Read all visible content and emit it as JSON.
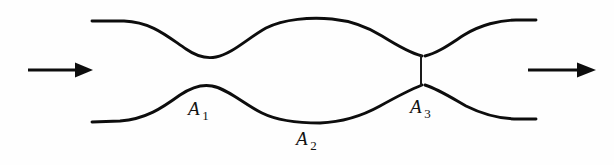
{
  "figure": {
    "name": "converging-diverging-duct-cross-sections",
    "type": "diagram",
    "background_color": "#fefefe",
    "stroke_color": "#0d0d0d",
    "width": 614,
    "height": 165
  },
  "labels": {
    "a1": {
      "symbol": "A",
      "subscript": "1",
      "x": 188,
      "y": 99
    },
    "a2": {
      "symbol": "A",
      "subscript": "2",
      "x": 296,
      "y": 129
    },
    "a3": {
      "symbol": "A",
      "subscript": "3",
      "x": 410,
      "y": 97
    }
  },
  "arrows": {
    "inlet": {
      "label": "inlet-flow-direction",
      "shaft_start_x": 28,
      "shaft_end_x": 78,
      "tip_x": 93,
      "y": 70
    },
    "outlet": {
      "label": "outlet-flow-direction",
      "shaft_start_x": 528,
      "shaft_end_x": 580,
      "tip_x": 596,
      "y": 70
    }
  },
  "geometry": {
    "upper_wall_path": "M 92 21 L 124 21 C 152 22 168 37 186 49 C 196 56 206 59 216 57 C 232 54 248 38 266 28 C 284 19 310 17 332 19 C 352 21 366 26 382 36 C 398 46 410 53 422 56",
    "upper_wall_right_path": "M 425 56 C 438 53 450 44 464 35 C 480 25 500 20 516 20 L 536 20",
    "lower_wall_path": "M 92 122 L 120 121 C 146 119 162 108 180 95 C 192 87 202 84 212 86 C 228 89 244 104 262 113 C 278 121 300 123 320 123 C 344 122 362 116 380 106 C 398 96 412 89 422 85",
    "lower_wall_right_path": "M 425 85 C 438 89 452 98 466 106 C 482 114 502 119 518 119 L 536 119",
    "throat": {
      "x": 421,
      "y_top": 55,
      "y_bottom": 86
    }
  }
}
